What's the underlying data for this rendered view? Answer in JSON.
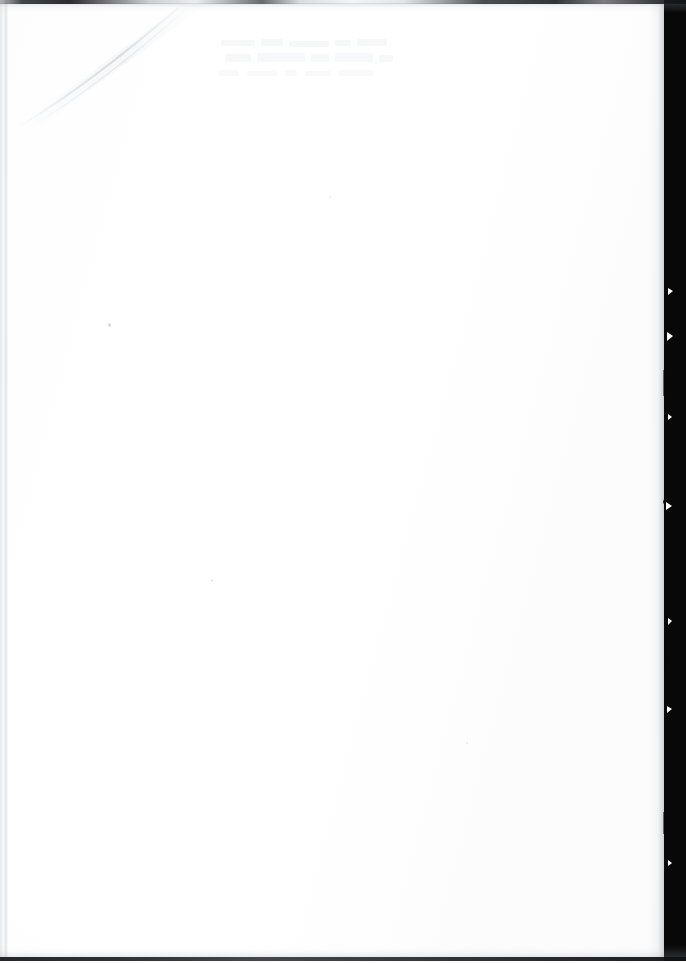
{
  "document": {
    "kind": "scanned-page",
    "page_state": "blank",
    "content_text": "",
    "orientation": "portrait",
    "width_px": 686,
    "height_px": 963
  },
  "surface": {
    "paper_color": "#fdfdfd",
    "background_color": "#ffffff",
    "vignette_color": "#eceef2"
  },
  "edges": {
    "top": {
      "name": "top-edge-line",
      "color": "#1a1c20",
      "thickness_px": 4
    },
    "bottom": {
      "name": "bottom-edge-line",
      "color": "#16181c",
      "thickness_px": 4
    },
    "right": {
      "name": "right-edge-black-band",
      "color": "#080809",
      "width_px": 22,
      "boundary": "ragged"
    },
    "left": {
      "name": "left-margin-rule",
      "color": "#d6d9de",
      "thickness_px": 4
    }
  },
  "artifacts": {
    "corner_fold": {
      "name": "top-left-corner-crease",
      "color": "#e4e6ea"
    },
    "bleed_through": {
      "name": "reverse-side-bleed-through",
      "color": "#f4f5f7",
      "legible": false
    },
    "specks": {
      "name": "dust-specks",
      "color": "#bcbec4",
      "count": 4
    }
  }
}
